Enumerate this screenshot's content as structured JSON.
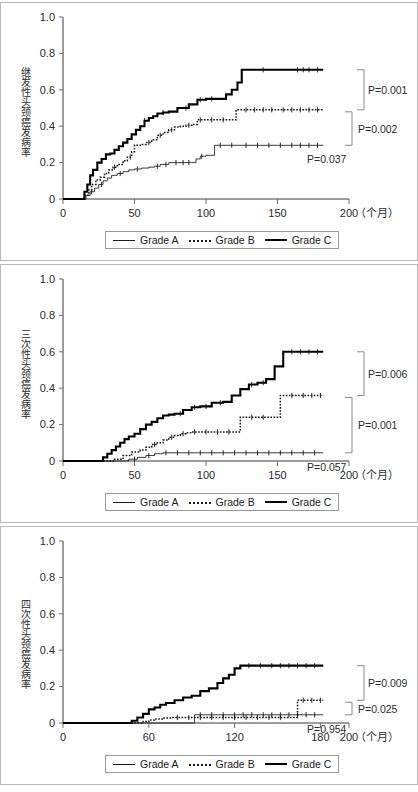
{
  "figure": {
    "background": "#ffffff",
    "axis_color": "#3a3a3a",
    "series_colors": {
      "Grade A": "#262626",
      "Grade B": "#141414",
      "Grade C": "#000000"
    }
  },
  "legend": {
    "items": [
      {
        "label": "Grade A",
        "style": "thin-solid"
      },
      {
        "label": "Grade B",
        "style": "dotted"
      },
      {
        "label": "Grade C",
        "style": "thick-solid"
      }
    ]
  },
  "panels": [
    {
      "id": "panel-1",
      "ylabel": "继发性头颈癌发病率",
      "xunit": "（个月）",
      "xticks": [
        0,
        50,
        100,
        150,
        200
      ],
      "xtick_labels": [
        "0",
        "50",
        "100",
        "150",
        "200"
      ],
      "yticks": [
        0,
        0.2,
        0.4,
        0.6,
        0.8,
        1.0
      ],
      "ytick_labels": [
        "0",
        "0.2",
        "0.4",
        "0.6",
        "0.8",
        "1.0"
      ],
      "pvalues": [
        {
          "text": "P=0.001",
          "pairs": "Grade C vs Grade B"
        },
        {
          "text": "P=0.002",
          "pairs": "Grade C vs Grade A"
        },
        {
          "text": "P=0.037",
          "pairs": "Grade B vs Grade A"
        }
      ]
    },
    {
      "id": "panel-2",
      "ylabel": "三次性头颈癌发病率",
      "xunit": "（个月）",
      "xticks": [
        0,
        50,
        100,
        150,
        200
      ],
      "xtick_labels": [
        "0",
        "50",
        "100",
        "150",
        "200"
      ],
      "yticks": [
        0,
        0.2,
        0.4,
        0.6,
        0.8,
        1.0
      ],
      "ytick_labels": [
        "0",
        "0.2",
        "0.4",
        "0.6",
        "0.8",
        "1.0"
      ],
      "pvalues": [
        {
          "text": "P=0.006",
          "pairs": "Grade C vs Grade B"
        },
        {
          "text": "P=0.001",
          "pairs": "Grade C vs Grade A"
        },
        {
          "text": "P=0.057",
          "pairs": "Grade B vs Grade A"
        }
      ]
    },
    {
      "id": "panel-3",
      "ylabel": "四次性头颈癌发病率",
      "xunit": "（个月）",
      "xticks": [
        0,
        60,
        120,
        180,
        200
      ],
      "xtick_labels": [
        "0",
        "60",
        "120",
        "180",
        "200"
      ],
      "yticks": [
        0,
        0.2,
        0.4,
        0.6,
        0.8,
        1.0
      ],
      "ytick_labels": [
        "0",
        "0.2",
        "0.4",
        "0.6",
        "0.8",
        "1.0"
      ],
      "pvalues": [
        {
          "text": "P=0.009",
          "pairs": "Grade C vs Grade B"
        },
        {
          "text": "P=0.025",
          "pairs": "Grade C vs Grade A"
        },
        {
          "text": "P=0.954",
          "pairs": "Grade B vs Grade A"
        }
      ]
    }
  ],
  "chart_data": [
    {
      "type": "line",
      "chart_id": "panel-1",
      "title": "",
      "xlabel": "（个月）",
      "ylabel": "继发性头颈癌发病率",
      "xlim": [
        0,
        200
      ],
      "ylim": [
        0,
        1.0
      ],
      "grid": false,
      "legend_position": "bottom",
      "annotations": [
        "P=0.001",
        "P=0.002",
        "P=0.037"
      ],
      "series": [
        {
          "name": "Grade A",
          "style": "thin-solid",
          "x": [
            0,
            13,
            16,
            19,
            22,
            25,
            28,
            31,
            34,
            38,
            42,
            46,
            50,
            55,
            60,
            64,
            68,
            74,
            80,
            86,
            90,
            93,
            96,
            100,
            103,
            106,
            125,
            150,
            182
          ],
          "y": [
            0,
            0,
            0.02,
            0.04,
            0.06,
            0.08,
            0.1,
            0.115,
            0.13,
            0.14,
            0.15,
            0.16,
            0.165,
            0.17,
            0.175,
            0.18,
            0.19,
            0.2,
            0.2,
            0.2,
            0.2,
            0.22,
            0.235,
            0.24,
            0.24,
            0.295,
            0.295,
            0.295,
            0.295
          ],
          "censor_x": [
            20,
            27,
            40,
            52,
            66,
            72,
            79,
            84,
            88,
            97,
            110,
            118,
            128,
            136,
            144,
            152,
            160,
            166,
            172,
            178
          ]
        },
        {
          "name": "Grade B",
          "style": "dotted",
          "x": [
            0,
            13,
            15,
            18,
            20,
            23,
            26,
            29,
            32,
            35,
            38,
            42,
            45,
            48,
            50,
            54,
            58,
            62,
            66,
            70,
            74,
            78,
            82,
            86,
            90,
            94,
            98,
            100,
            118,
            121,
            150,
            182
          ],
          "y": [
            0,
            0,
            0.02,
            0.05,
            0.08,
            0.105,
            0.12,
            0.14,
            0.16,
            0.175,
            0.19,
            0.21,
            0.23,
            0.26,
            0.295,
            0.3,
            0.31,
            0.325,
            0.35,
            0.365,
            0.38,
            0.395,
            0.4,
            0.405,
            0.41,
            0.435,
            0.435,
            0.435,
            0.435,
            0.49,
            0.49,
            0.49
          ],
          "censor_x": [
            36,
            47,
            60,
            68,
            76,
            88,
            96,
            104,
            112,
            128,
            134,
            140,
            146,
            154,
            160,
            166,
            172,
            178
          ]
        },
        {
          "name": "Grade C",
          "style": "thick-solid",
          "x": [
            0,
            13,
            15,
            17,
            19,
            21,
            24,
            27,
            30,
            33,
            36,
            39,
            42,
            45,
            48,
            51,
            54,
            57,
            60,
            63,
            66,
            70,
            74,
            80,
            88,
            94,
            100,
            108,
            114,
            118,
            122,
            125,
            150,
            182
          ],
          "y": [
            0,
            0,
            0.04,
            0.08,
            0.13,
            0.16,
            0.2,
            0.22,
            0.245,
            0.25,
            0.27,
            0.29,
            0.31,
            0.33,
            0.355,
            0.38,
            0.4,
            0.43,
            0.445,
            0.455,
            0.47,
            0.475,
            0.48,
            0.5,
            0.52,
            0.545,
            0.55,
            0.55,
            0.575,
            0.6,
            0.64,
            0.71,
            0.71,
            0.71
          ],
          "censor_x": [
            57,
            70,
            86,
            96,
            104,
            140,
            164,
            168,
            172,
            178
          ]
        }
      ]
    },
    {
      "type": "line",
      "chart_id": "panel-2",
      "title": "",
      "xlabel": "（个月）",
      "ylabel": "三次性头颈癌发病率",
      "xlim": [
        0,
        200
      ],
      "ylim": [
        0,
        1.0
      ],
      "grid": false,
      "legend_position": "bottom",
      "annotations": [
        "P=0.006",
        "P=0.001",
        "P=0.057"
      ],
      "series": [
        {
          "name": "Grade A",
          "style": "thin-solid",
          "x": [
            0,
            40,
            46,
            52,
            58,
            64,
            70,
            182
          ],
          "y": [
            0,
            0,
            0.01,
            0.02,
            0.03,
            0.04,
            0.045,
            0.045
          ],
          "censor_x": [
            50,
            60,
            72,
            80,
            88,
            96,
            104,
            112,
            120,
            128,
            136,
            144,
            152,
            160,
            168,
            176
          ]
        },
        {
          "name": "Grade B",
          "style": "dotted",
          "x": [
            0,
            30,
            36,
            42,
            48,
            54,
            58,
            62,
            66,
            70,
            74,
            78,
            82,
            86,
            90,
            120,
            124,
            148,
            152,
            182
          ],
          "y": [
            0,
            0,
            0.01,
            0.03,
            0.05,
            0.06,
            0.075,
            0.09,
            0.1,
            0.115,
            0.13,
            0.14,
            0.15,
            0.155,
            0.16,
            0.16,
            0.24,
            0.24,
            0.36,
            0.36
          ],
          "censor_x": [
            64,
            76,
            84,
            92,
            100,
            108,
            116,
            132,
            140,
            160,
            168,
            174,
            180
          ]
        },
        {
          "name": "Grade C",
          "style": "thick-solid",
          "x": [
            0,
            24,
            28,
            31,
            34,
            37,
            40,
            43,
            46,
            50,
            54,
            58,
            62,
            66,
            70,
            74,
            78,
            84,
            90,
            96,
            104,
            112,
            118,
            124,
            130,
            136,
            142,
            148,
            154,
            182
          ],
          "y": [
            0,
            0,
            0.02,
            0.04,
            0.06,
            0.08,
            0.1,
            0.12,
            0.135,
            0.15,
            0.175,
            0.2,
            0.215,
            0.235,
            0.25,
            0.255,
            0.26,
            0.28,
            0.295,
            0.3,
            0.32,
            0.325,
            0.36,
            0.395,
            0.42,
            0.43,
            0.45,
            0.52,
            0.6,
            0.6
          ],
          "censor_x": [
            82,
            92,
            100,
            110,
            132,
            140,
            160,
            166,
            172,
            178
          ]
        }
      ]
    },
    {
      "type": "line",
      "chart_id": "panel-3",
      "title": "",
      "xlabel": "（个月）",
      "ylabel": "四次性头颈癌发病率",
      "xlim": [
        0,
        200
      ],
      "ylim": [
        0,
        1.0
      ],
      "grid": false,
      "legend_position": "bottom",
      "annotations": [
        "P=0.009",
        "P=0.025",
        "P=0.954"
      ],
      "series": [
        {
          "name": "Grade A",
          "style": "thin-solid",
          "x": [
            0,
            88,
            92,
            182
          ],
          "y": [
            0,
            0,
            0.045,
            0.045
          ],
          "censor_x": [
            96,
            104,
            112,
            120,
            126,
            132,
            140,
            146,
            152,
            158,
            164,
            170,
            176
          ]
        },
        {
          "name": "Grade B",
          "style": "dotted",
          "x": [
            0,
            52,
            56,
            60,
            64,
            70,
            76,
            160,
            164,
            182
          ],
          "y": [
            0,
            0,
            0.008,
            0.016,
            0.022,
            0.028,
            0.03,
            0.03,
            0.125,
            0.125
          ],
          "censor_x": [
            80,
            88,
            96,
            104,
            112,
            120,
            128,
            136,
            144,
            152,
            168,
            174,
            180
          ]
        },
        {
          "name": "Grade C",
          "style": "thick-solid",
          "x": [
            0,
            44,
            48,
            52,
            56,
            60,
            64,
            68,
            72,
            78,
            84,
            90,
            96,
            102,
            108,
            112,
            116,
            120,
            124,
            182
          ],
          "y": [
            0,
            0,
            0.012,
            0.03,
            0.05,
            0.075,
            0.085,
            0.1,
            0.11,
            0.125,
            0.14,
            0.15,
            0.175,
            0.19,
            0.22,
            0.245,
            0.265,
            0.3,
            0.315,
            0.315
          ],
          "censor_x": [
            130,
            138,
            146,
            152,
            158,
            164,
            170,
            176
          ]
        }
      ]
    }
  ]
}
